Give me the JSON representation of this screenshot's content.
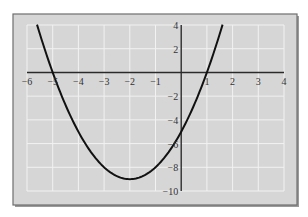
{
  "chart_data": {
    "type": "line",
    "title": "",
    "xlabel": "",
    "ylabel": "",
    "function": "y = x^2 + 4x - 5",
    "xlim": [
      -6,
      4
    ],
    "ylim": [
      -10,
      4
    ],
    "grid": true,
    "x_ticks": [
      -6,
      -5,
      -4,
      -3,
      -2,
      -1,
      1,
      2,
      3,
      4
    ],
    "x_tick_labels": [
      "−6",
      "−5",
      "−4",
      "−3",
      "−2",
      "−1",
      "1",
      "2",
      "3",
      "4"
    ],
    "y_ticks": [
      4,
      2,
      -2,
      -4,
      -6,
      -8,
      -10
    ],
    "y_tick_labels": [
      "4",
      "2",
      "−2",
      "−4",
      "−6",
      "−8",
      "−10"
    ],
    "series": [
      {
        "name": "parabola",
        "x": [
          -5.61,
          -5,
          -4,
          -3,
          -2,
          -1,
          0,
          1,
          1.61
        ],
        "y": [
          4,
          0,
          -5,
          -8,
          -9,
          -8,
          -5,
          0,
          4
        ]
      }
    ],
    "key_points": {
      "vertex": [
        -2,
        -9
      ],
      "x_intercepts": [
        -5,
        1
      ],
      "y_intercept": -5
    }
  },
  "colors": {
    "plot_background": "#d6d6d6",
    "grid": "#f2f2f2",
    "frame": "#6e6e6e",
    "curve": "#111111",
    "axes": "#2a2a2a"
  }
}
